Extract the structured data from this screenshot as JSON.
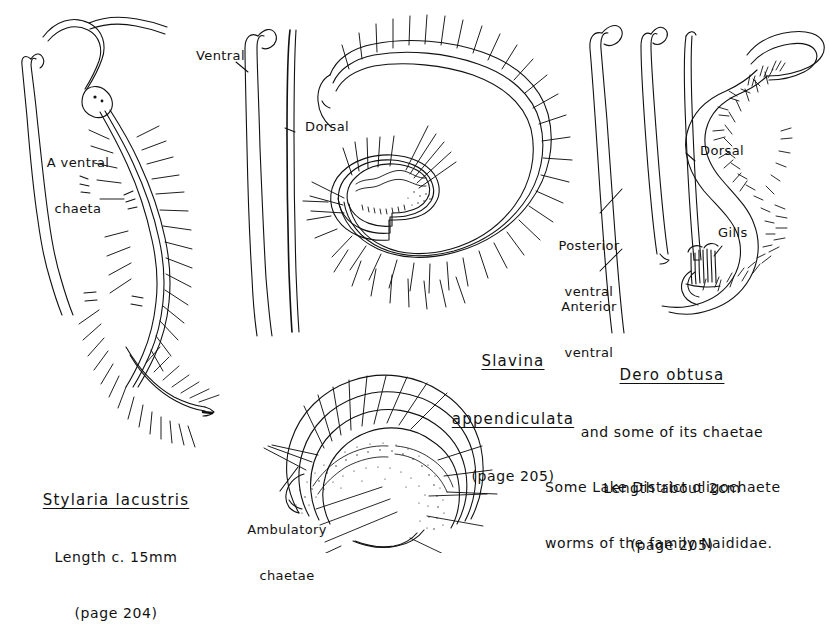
{
  "plate": {
    "overall_caption_line1": "Some Lake District oligochaete",
    "overall_caption_line2": "worms of the family Naididae.",
    "ink_color": "#111111",
    "background_color": "#ffffff"
  },
  "figures": [
    {
      "id": "stylaria",
      "species": "Stylaria lacustris",
      "length_note": "Length c. 15mm",
      "page_note": "(page 204)",
      "annotations": [
        {
          "name": "a-ventral-chaeta",
          "line1": "A ventral",
          "line2": "chaeta"
        }
      ]
    },
    {
      "id": "slavina",
      "species_line1": "Slavina",
      "species_line2": "appendiculata",
      "page_note": "(page 205)",
      "annotations": [
        {
          "name": "ventral",
          "text": "Ventral"
        },
        {
          "name": "dorsal",
          "text": "Dorsal"
        },
        {
          "name": "ambulatory-chaetae",
          "line1": "Ambulatory",
          "line2": "chaetae"
        }
      ]
    },
    {
      "id": "dero",
      "species": "Dero obtusa",
      "subtitle": "and some of its chaetae",
      "length_note": "Length about 2cm",
      "page_note": "(page 205)",
      "annotations": [
        {
          "name": "posterior-ventral",
          "line1": "Posterior",
          "line2": "ventral"
        },
        {
          "name": "anterior-ventral",
          "line1": "Anterior",
          "line2": "ventral"
        },
        {
          "name": "dorsal",
          "text": "Dorsal"
        },
        {
          "name": "gills",
          "text": "Gills"
        }
      ]
    }
  ]
}
